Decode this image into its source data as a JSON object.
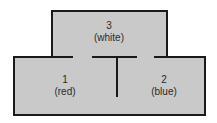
{
  "diagram": {
    "fill_color": "#c9c9c9",
    "line_color": "#1a1a1a",
    "regions": [
      {
        "id": "1",
        "number": "1",
        "label": "(red)"
      },
      {
        "id": "2",
        "number": "2",
        "label": "(blue)"
      },
      {
        "id": "3",
        "number": "3",
        "label": "(white)"
      }
    ]
  }
}
